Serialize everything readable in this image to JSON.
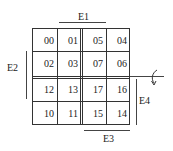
{
  "diagram": {
    "type": "karnaugh-map-with-edges",
    "grid": [
      [
        "00",
        "01",
        "05",
        "04"
      ],
      [
        "02",
        "03",
        "07",
        "06"
      ],
      [
        "12",
        "13",
        "17",
        "16"
      ],
      [
        "10",
        "11",
        "15",
        "14"
      ]
    ],
    "labels": {
      "e1": "E1",
      "e2": "E2",
      "e3": "E3",
      "e4": "E4"
    },
    "cells": {
      "r0c0": "00",
      "r0c1": "01",
      "r0c2": "05",
      "r0c3": "04",
      "r1c0": "02",
      "r1c1": "03",
      "r1c2": "07",
      "r1c3": "06",
      "r2c0": "12",
      "r2c1": "13",
      "r2c2": "17",
      "r2c3": "16",
      "r3c0": "10",
      "r3c1": "11",
      "r3c2": "15",
      "r3c3": "14"
    },
    "annotations": {
      "double_lines": [
        "vertical-between-col1-col2",
        "horizontal-between-row1-row2"
      ],
      "rotation_arrow": "curved-arrow-icon at right of horizontal axis"
    }
  }
}
